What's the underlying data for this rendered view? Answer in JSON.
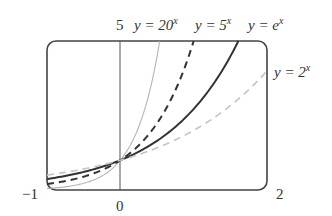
{
  "chart_data": {
    "type": "line",
    "title": "",
    "xlabel": "",
    "ylabel": "",
    "xlim": [
      -1,
      2
    ],
    "ylim": [
      0,
      5
    ],
    "grid": false,
    "tick_labels": {
      "x_min": "−1",
      "x_zero": "0",
      "x_max": "2",
      "y_max": "5"
    },
    "series": [
      {
        "name": "y = 20^x",
        "label_base": "y = 20",
        "label_exp": "x",
        "base": 20,
        "style": "solid-thin",
        "color": "#b5b5b5",
        "x": [
          -1,
          -0.5,
          0,
          0.25,
          0.5,
          0.537
        ],
        "values": [
          0.05,
          0.224,
          1,
          2.115,
          4.472,
          5
        ]
      },
      {
        "name": "y = 5^x",
        "label_base": "y = 5",
        "label_exp": "x",
        "base": 5,
        "style": "dashed",
        "color": "#333333",
        "x": [
          -1,
          -0.5,
          0,
          0.5,
          1
        ],
        "values": [
          0.2,
          0.447,
          1,
          2.236,
          5
        ]
      },
      {
        "name": "y = e^x",
        "label_base": "y = e",
        "label_exp": "x",
        "base": 2.71828,
        "style": "solid-thick",
        "color": "#333333",
        "x": [
          -1,
          -0.5,
          0,
          0.5,
          1,
          1.5,
          1.609
        ],
        "values": [
          0.368,
          0.607,
          1,
          1.649,
          2.718,
          4.482,
          5
        ]
      },
      {
        "name": "y = 2^x",
        "label_base": "y = 2",
        "label_exp": "x",
        "base": 2,
        "style": "dashed-light",
        "color": "#c4c4c4",
        "x": [
          -1,
          -0.5,
          0,
          0.5,
          1,
          1.5,
          2
        ],
        "values": [
          0.5,
          0.707,
          1,
          1.414,
          2,
          2.828,
          4
        ]
      }
    ],
    "legend_position": "inline-labels-top-and-right"
  }
}
